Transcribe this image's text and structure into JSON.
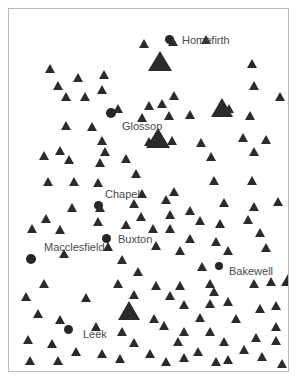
{
  "figure": {
    "background_color": "#ffffff",
    "frame_color": "#b9b9b9",
    "marker_color": "#2b2b2b",
    "city_marker_color": "#262626",
    "label_color": "#4a4a4a",
    "width": 300,
    "height": 387
  },
  "chart_data": {
    "type": "scatter",
    "title": "",
    "xlabel": "",
    "ylabel": "",
    "xlim": [
      0,
      281
    ],
    "ylim": [
      0,
      364
    ],
    "grid": false,
    "legend": null,
    "series": [
      {
        "name": "settlements",
        "marker": "circle",
        "label_position": "right",
        "points": [
          {
            "label": "Homefirth",
            "x": 156,
            "y": 26,
            "size": 9,
            "label_dx": 8,
            "label_dy": 0
          },
          {
            "label": "Glossop",
            "x": 97,
            "y": 99,
            "size": 10,
            "label_dx": 6,
            "label_dy": 13
          },
          {
            "label": "Chapel",
            "x": 85,
            "y": 192,
            "size": 9,
            "label_dx": 2,
            "label_dy": -12
          },
          {
            "label": "Buxton",
            "x": 93,
            "y": 225,
            "size": 9,
            "label_dx": 7,
            "label_dy": 0
          },
          {
            "label": "Macclesfield",
            "x": 17,
            "y": 245,
            "size": 10,
            "label_dx": 8,
            "label_dy": -12
          },
          {
            "label": "Bakewell",
            "x": 206,
            "y": 253,
            "size": 8,
            "label_dx": 6,
            "label_dy": 4
          },
          {
            "label": "Leek",
            "x": 55,
            "y": 316,
            "size": 9,
            "label_dx": 10,
            "label_dy": 4
          }
        ]
      },
      {
        "name": "sites-large",
        "marker": "triangle",
        "points": [
          {
            "x": 139,
            "y": 42,
            "size": 24
          },
          {
            "x": 137,
            "y": 119,
            "size": 24
          },
          {
            "x": 202,
            "y": 89,
            "size": 22
          },
          {
            "x": 272,
            "y": 258,
            "size": 22
          },
          {
            "x": 109,
            "y": 292,
            "size": 22
          }
        ]
      },
      {
        "name": "sites-small",
        "marker": "triangle",
        "points": [
          {
            "x": 36,
            "y": 55
          },
          {
            "x": 64,
            "y": 64
          },
          {
            "x": 90,
            "y": 61
          },
          {
            "x": 44,
            "y": 72
          },
          {
            "x": 88,
            "y": 76
          },
          {
            "x": 52,
            "y": 83
          },
          {
            "x": 71,
            "y": 83
          },
          {
            "x": 130,
            "y": 30
          },
          {
            "x": 159,
            "y": 28
          },
          {
            "x": 192,
            "y": 26
          },
          {
            "x": 238,
            "y": 50
          },
          {
            "x": 240,
            "y": 72
          },
          {
            "x": 266,
            "y": 83
          },
          {
            "x": 160,
            "y": 82
          },
          {
            "x": 104,
            "y": 95
          },
          {
            "x": 135,
            "y": 92
          },
          {
            "x": 148,
            "y": 90
          },
          {
            "x": 52,
            "y": 112
          },
          {
            "x": 78,
            "y": 113
          },
          {
            "x": 128,
            "y": 104
          },
          {
            "x": 155,
            "y": 102
          },
          {
            "x": 176,
            "y": 101
          },
          {
            "x": 215,
            "y": 95
          },
          {
            "x": 236,
            "y": 102
          },
          {
            "x": 46,
            "y": 137
          },
          {
            "x": 88,
            "y": 127
          },
          {
            "x": 91,
            "y": 138
          },
          {
            "x": 135,
            "y": 128
          },
          {
            "x": 158,
            "y": 127
          },
          {
            "x": 187,
            "y": 129
          },
          {
            "x": 229,
            "y": 124
          },
          {
            "x": 252,
            "y": 126
          },
          {
            "x": 30,
            "y": 142
          },
          {
            "x": 55,
            "y": 146
          },
          {
            "x": 86,
            "y": 149
          },
          {
            "x": 112,
            "y": 145
          },
          {
            "x": 197,
            "y": 143
          },
          {
            "x": 240,
            "y": 138
          },
          {
            "x": 34,
            "y": 168
          },
          {
            "x": 60,
            "y": 168
          },
          {
            "x": 84,
            "y": 169
          },
          {
            "x": 122,
            "y": 160
          },
          {
            "x": 128,
            "y": 180
          },
          {
            "x": 160,
            "y": 178
          },
          {
            "x": 200,
            "y": 167
          },
          {
            "x": 238,
            "y": 167
          },
          {
            "x": 86,
            "y": 194
          },
          {
            "x": 120,
            "y": 190
          },
          {
            "x": 152,
            "y": 186
          },
          {
            "x": 176,
            "y": 197
          },
          {
            "x": 210,
            "y": 189
          },
          {
            "x": 240,
            "y": 193
          },
          {
            "x": 264,
            "y": 188
          },
          {
            "x": 58,
            "y": 194
          },
          {
            "x": 32,
            "y": 205
          },
          {
            "x": 84,
            "y": 208
          },
          {
            "x": 112,
            "y": 211
          },
          {
            "x": 127,
            "y": 203
          },
          {
            "x": 156,
            "y": 201
          },
          {
            "x": 186,
            "y": 207
          },
          {
            "x": 206,
            "y": 210
          },
          {
            "x": 234,
            "y": 206
          },
          {
            "x": 246,
            "y": 219
          },
          {
            "x": 18,
            "y": 215
          },
          {
            "x": 46,
            "y": 216
          },
          {
            "x": 139,
            "y": 215
          },
          {
            "x": 156,
            "y": 215
          },
          {
            "x": 176,
            "y": 225
          },
          {
            "x": 202,
            "y": 228
          },
          {
            "x": 214,
            "y": 237
          },
          {
            "x": 252,
            "y": 234
          },
          {
            "x": 94,
            "y": 233
          },
          {
            "x": 142,
            "y": 232
          },
          {
            "x": 50,
            "y": 240
          },
          {
            "x": 166,
            "y": 237
          },
          {
            "x": 108,
            "y": 246
          },
          {
            "x": 124,
            "y": 258
          },
          {
            "x": 188,
            "y": 253
          },
          {
            "x": 30,
            "y": 270
          },
          {
            "x": 104,
            "y": 270
          },
          {
            "x": 142,
            "y": 272
          },
          {
            "x": 166,
            "y": 272
          },
          {
            "x": 196,
            "y": 270
          },
          {
            "x": 240,
            "y": 270
          },
          {
            "x": 257,
            "y": 268
          },
          {
            "x": 200,
            "y": 278
          },
          {
            "x": 12,
            "y": 283
          },
          {
            "x": 72,
            "y": 284
          },
          {
            "x": 120,
            "y": 281
          },
          {
            "x": 156,
            "y": 282
          },
          {
            "x": 170,
            "y": 291
          },
          {
            "x": 196,
            "y": 290
          },
          {
            "x": 214,
            "y": 288
          },
          {
            "x": 246,
            "y": 295
          },
          {
            "x": 262,
            "y": 292
          },
          {
            "x": 24,
            "y": 300
          },
          {
            "x": 46,
            "y": 306
          },
          {
            "x": 140,
            "y": 305
          },
          {
            "x": 186,
            "y": 304
          },
          {
            "x": 222,
            "y": 305
          },
          {
            "x": 262,
            "y": 313
          },
          {
            "x": 82,
            "y": 313
          },
          {
            "x": 108,
            "y": 318
          },
          {
            "x": 150,
            "y": 312
          },
          {
            "x": 170,
            "y": 318
          },
          {
            "x": 196,
            "y": 318
          },
          {
            "x": 14,
            "y": 326
          },
          {
            "x": 38,
            "y": 330
          },
          {
            "x": 120,
            "y": 329
          },
          {
            "x": 164,
            "y": 328
          },
          {
            "x": 210,
            "y": 328
          },
          {
            "x": 242,
            "y": 324
          },
          {
            "x": 262,
            "y": 327
          },
          {
            "x": 62,
            "y": 338
          },
          {
            "x": 88,
            "y": 340
          },
          {
            "x": 136,
            "y": 340
          },
          {
            "x": 184,
            "y": 338
          },
          {
            "x": 230,
            "y": 336
          },
          {
            "x": 16,
            "y": 347
          },
          {
            "x": 44,
            "y": 347
          },
          {
            "x": 106,
            "y": 345
          },
          {
            "x": 152,
            "y": 348
          },
          {
            "x": 170,
            "y": 344
          },
          {
            "x": 202,
            "y": 348
          },
          {
            "x": 214,
            "y": 346
          },
          {
            "x": 248,
            "y": 343
          },
          {
            "x": 268,
            "y": 350
          }
        ]
      }
    ]
  }
}
